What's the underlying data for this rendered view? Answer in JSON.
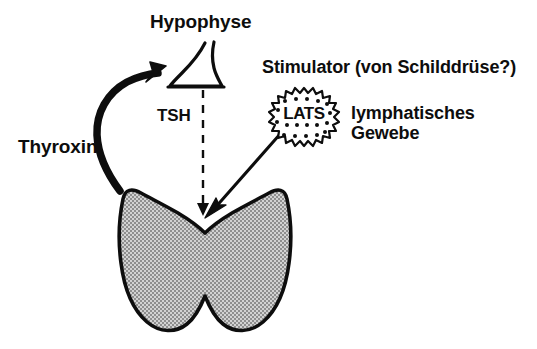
{
  "diagram": {
    "background_color": "#ffffff",
    "ink_color": "#0d0d0d",
    "gland_fill_color": "#b5b5b5",
    "labels": {
      "hypophyse": "Hypophyse",
      "stimulator": "Stimulator (von Schilddrüse?)",
      "lymphatic_tissue_line1": "lymphatisches",
      "lymphatic_tissue_line2": "Gewebe",
      "thyroxin": "Thyroxin",
      "tsh": "TSH",
      "lats": "LATS"
    },
    "elements": {
      "pituitary_name": "Hypophyse (pituitary gland)",
      "thyroid_name": "Schilddrüse (thyroid gland)",
      "lats_cell_name": "LATS lymphatic cell",
      "thyroxin_arrow_name": "Thyroxin feedback arrow",
      "tsh_arrow_name": "TSH dashed arrow",
      "lats_arrow_name": "LATS stimulation arrow"
    }
  }
}
